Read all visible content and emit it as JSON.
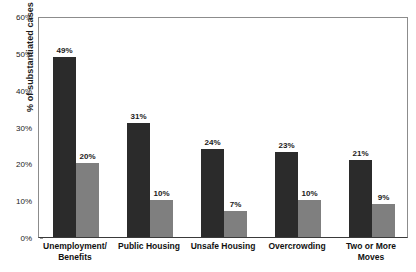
{
  "chart_data": {
    "type": "bar",
    "title": "",
    "subtitle": "",
    "xlabel": "",
    "ylabel": "% of substantiated cases",
    "ylim": [
      0,
      60
    ],
    "y_tick_labels": [
      "0%",
      "10%",
      "20%",
      "30%",
      "40%",
      "50%",
      "60%"
    ],
    "y_tick_values": [
      0,
      10,
      20,
      30,
      40,
      50,
      60
    ],
    "grid": false,
    "legend_position": "top-right",
    "categories": [
      "Unemployment/ Benefits",
      "Public Housing",
      "Unsafe Housing",
      "Overcrowding",
      "Two or More Moves"
    ],
    "category_lines": [
      [
        "Unemployment/",
        "Benefits"
      ],
      [
        "Public Housing",
        ""
      ],
      [
        "Unsafe Housing",
        ""
      ],
      [
        "Overcrowding",
        ""
      ],
      [
        "Two or More",
        "Moves"
      ]
    ],
    "series": [
      {
        "name": "First Nations",
        "color": "#2b2b2b",
        "values": [
          49,
          31,
          24,
          23,
          21
        ],
        "value_labels": [
          "49%",
          "31%",
          "24%",
          "23%",
          "21%"
        ]
      },
      {
        "name": "Non-Aboriginal",
        "color": "#7f7f7f",
        "values": [
          20,
          10,
          7,
          10,
          9
        ],
        "value_labels": [
          "20%",
          "10%",
          "7%",
          "10%",
          "9%"
        ]
      }
    ]
  },
  "legend": {
    "items": [
      {
        "label": "First Nations",
        "swatch": "dark"
      },
      {
        "label": "Non-Aboriginal",
        "swatch": "gray"
      }
    ]
  }
}
